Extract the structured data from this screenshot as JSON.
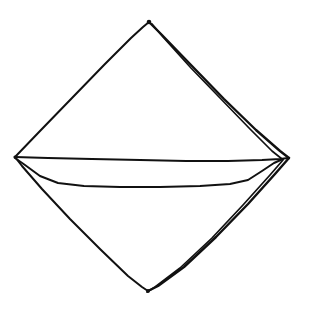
{
  "document": {
    "title": "Folded Napkin Sketch",
    "type": "line-drawing",
    "medium": "hand-drawn ink sketch",
    "subject": "folded napkin / handkerchief shown as a diamond with a horizontal fold"
  },
  "canvas": {
    "width": 309,
    "height": 318,
    "background_color": "#ffffff",
    "ink_color": "#111111"
  },
  "drawing": {
    "vertices": {
      "top": {
        "label": "top-apex",
        "x": 149,
        "y": 22
      },
      "left": {
        "label": "left-vertex",
        "x": 15,
        "y": 157
      },
      "right": {
        "label": "right-vertex",
        "x": 288,
        "y": 158
      },
      "bottom": {
        "label": "bottom-apex",
        "x": 148,
        "y": 291
      }
    },
    "strokes": {
      "upper_left_edge": "M 15 157 L 40 131 L 72 98 L 104 65 L 131 38 L 143 27 L 149 22",
      "lower_left_edge": "M 15 157 L 22 166 L 42 189 L 70 219 L 100 249 L 128 276 L 142 287 L 148 291",
      "upper_right_edge_outer": "M 149 22 L 162 35 L 192 66 L 224 99 L 256 130 L 280 151 L 289 158",
      "upper_right_edge_inner": "M 152 24 L 163 37 L 191 68 L 221 99 L 250 129 L 272 151 L 282 159",
      "lower_right_edge_outer": "M 289 158 L 275 174 L 248 204 L 216 237 L 184 267 L 158 286 L 148 291",
      "lower_right_edge_inner": "M 283 160 L 270 175 L 243 205 L 212 238 L 180 268 L 155 287 L 147 292",
      "upper_fold_line": "M 15 157 L 48 158 L 92 159 L 140 160 L 186 161 L 228 161 L 262 160 L 280 159 L 288 158",
      "lower_fold_line": "M 15 158 L 25 165 L 40 176 L 58 183 L 84 186 L 120 187 L 160 187 L 200 186 L 230 184 L 248 180 L 262 171 L 274 163 L 283 159"
    },
    "stroke_count": 8,
    "features": [
      "single-weight left edges",
      "doubled right edges indicating a folded layer",
      "horizontal fold band across the middle",
      "sharp top and bottom apex points"
    ]
  }
}
